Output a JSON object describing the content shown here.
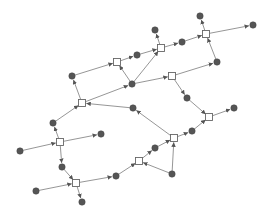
{
  "diagram": {
    "type": "petri-net",
    "colors": {
      "background": "#ffffff",
      "edge": "#8a8a8a",
      "arrow": "#555555",
      "place_fill": "#555555",
      "transition_fill": "#ffffff",
      "transition_stroke": "#666666"
    },
    "transitions": [
      {
        "id": "T1",
        "x": 117,
        "y": 62
      },
      {
        "id": "T2",
        "x": 161,
        "y": 48
      },
      {
        "id": "T3",
        "x": 206,
        "y": 34
      },
      {
        "id": "T4",
        "x": 172,
        "y": 76
      },
      {
        "id": "T5",
        "x": 82,
        "y": 103
      },
      {
        "id": "T6",
        "x": 60,
        "y": 142
      },
      {
        "id": "T7",
        "x": 76,
        "y": 183
      },
      {
        "id": "T8",
        "x": 174,
        "y": 138
      },
      {
        "id": "T9",
        "x": 139,
        "y": 161
      },
      {
        "id": "T10",
        "x": 209,
        "y": 117
      }
    ],
    "places": [
      {
        "id": "P1",
        "x": 72,
        "y": 76
      },
      {
        "id": "P2",
        "x": 137,
        "y": 55
      },
      {
        "id": "P3",
        "x": 155,
        "y": 30
      },
      {
        "id": "P4",
        "x": 182,
        "y": 42
      },
      {
        "id": "P5",
        "x": 200,
        "y": 16
      },
      {
        "id": "P6",
        "x": 253,
        "y": 25
      },
      {
        "id": "P7",
        "x": 217,
        "y": 62
      },
      {
        "id": "P8",
        "x": 132,
        "y": 84
      },
      {
        "id": "P9",
        "x": 133,
        "y": 108
      },
      {
        "id": "P10",
        "x": 187,
        "y": 98
      },
      {
        "id": "P11",
        "x": 53,
        "y": 123
      },
      {
        "id": "P12",
        "x": 20,
        "y": 151
      },
      {
        "id": "P13",
        "x": 101,
        "y": 134
      },
      {
        "id": "P14",
        "x": 62,
        "y": 167
      },
      {
        "id": "P15",
        "x": 36,
        "y": 191
      },
      {
        "id": "P16",
        "x": 116,
        "y": 176
      },
      {
        "id": "P17",
        "x": 82,
        "y": 202
      },
      {
        "id": "P18",
        "x": 155,
        "y": 148
      },
      {
        "id": "P19",
        "x": 172,
        "y": 174
      },
      {
        "id": "P20",
        "x": 192,
        "y": 131
      },
      {
        "id": "P21",
        "x": 234,
        "y": 108
      }
    ],
    "edges": [
      {
        "from": "P1",
        "to": "T1"
      },
      {
        "from": "T1",
        "to": "P2"
      },
      {
        "from": "P2",
        "to": "T2"
      },
      {
        "from": "P8",
        "to": "T1"
      },
      {
        "from": "T5",
        "to": "P1"
      },
      {
        "from": "T5",
        "to": "P8"
      },
      {
        "from": "P8",
        "to": "T2"
      },
      {
        "from": "T8",
        "to": "P9"
      },
      {
        "from": "P9",
        "to": "T5"
      },
      {
        "from": "P8",
        "to": "T4"
      },
      {
        "from": "T4",
        "to": "P10"
      },
      {
        "from": "P10",
        "to": "T10"
      },
      {
        "from": "T2",
        "to": "P3"
      },
      {
        "from": "T2",
        "to": "P4"
      },
      {
        "from": "P4",
        "to": "T3"
      },
      {
        "from": "T3",
        "to": "P5"
      },
      {
        "from": "T3",
        "to": "P6"
      },
      {
        "from": "P7",
        "to": "T3"
      },
      {
        "from": "T4",
        "to": "P7"
      },
      {
        "from": "T6",
        "to": "P11"
      },
      {
        "from": "P11",
        "to": "T5"
      },
      {
        "from": "P12",
        "to": "T6"
      },
      {
        "from": "T6",
        "to": "P13"
      },
      {
        "from": "T6",
        "to": "P14"
      },
      {
        "from": "P14",
        "to": "T7"
      },
      {
        "from": "P15",
        "to": "T7"
      },
      {
        "from": "T7",
        "to": "P16"
      },
      {
        "from": "T7",
        "to": "P17"
      },
      {
        "from": "P16",
        "to": "T9"
      },
      {
        "from": "T9",
        "to": "P18"
      },
      {
        "from": "P18",
        "to": "T8"
      },
      {
        "from": "P19",
        "to": "T9"
      },
      {
        "from": "P19",
        "to": "T8"
      },
      {
        "from": "T8",
        "to": "P20"
      },
      {
        "from": "P20",
        "to": "T10"
      },
      {
        "from": "T10",
        "to": "P21"
      }
    ]
  }
}
